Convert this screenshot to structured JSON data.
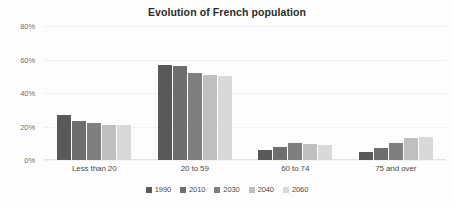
{
  "chart_data": {
    "type": "bar",
    "title": "Evolution of French population",
    "xlabel": "",
    "ylabel": "",
    "ylim": [
      0,
      80
    ],
    "grid": true,
    "legend_position": "bottom",
    "ytick_labels": [
      "0%",
      "20%",
      "40%",
      "60%",
      "80%"
    ],
    "ytick_values": [
      0,
      20,
      40,
      60,
      80
    ],
    "categories": [
      "Less than 20",
      "20 to 59",
      "60 to 74",
      "75 and over"
    ],
    "series": [
      {
        "name": "1990",
        "color": "#595959",
        "values": [
          27,
          57,
          6,
          5
        ]
      },
      {
        "name": "2010",
        "color": "#6e6e6e",
        "values": [
          23,
          56,
          8,
          7
        ]
      },
      {
        "name": "2030",
        "color": "#7f7f7f",
        "values": [
          22,
          52,
          10,
          10
        ]
      },
      {
        "name": "2040",
        "color": "#bfbfbf",
        "values": [
          21,
          51,
          9.5,
          13
        ]
      },
      {
        "name": "2060",
        "color": "#d9d9d9",
        "values": [
          21,
          50,
          9,
          14
        ]
      }
    ]
  },
  "colors": {
    "background": "#fdfdfd",
    "gridline": "#f1f1f1",
    "axis": "#e2e2e2",
    "title_text": "#2b2b2b",
    "tick_text": "#6d6d6d",
    "label_text": "#4a4a4a"
  }
}
